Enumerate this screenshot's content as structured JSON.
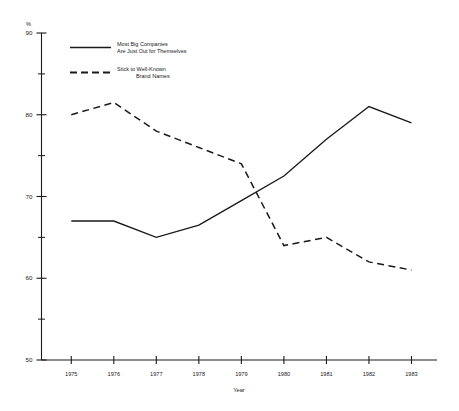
{
  "chart_data": {
    "type": "line",
    "title": "",
    "xlabel": "Year",
    "ylabel": "%",
    "unit_label": "%",
    "categories": [
      "1975",
      "1976",
      "1977",
      "1978",
      "1979",
      "1980",
      "1981",
      "1982",
      "1983"
    ],
    "x": [
      1975,
      1976,
      1977,
      1978,
      1979,
      1980,
      1981,
      1982,
      1983
    ],
    "ylim": [
      50,
      90
    ],
    "xlim": [
      1974.3,
      1983.6
    ],
    "grid": false,
    "legend_position": "top-left",
    "y_ticks_major": [
      50,
      60,
      70,
      80,
      90
    ],
    "y_ticks_minor": [
      55,
      65,
      75,
      85
    ],
    "y_tick_labels": [
      "50",
      "60",
      "70",
      "80",
      "90"
    ],
    "series": [
      {
        "name": "Most Big Companies Are Just Out for Themselves",
        "style": "solid",
        "color": "#1a1a1a",
        "values": [
          67,
          67,
          65,
          66.5,
          69.5,
          72.5,
          77,
          81,
          79
        ]
      },
      {
        "name": "Stick to Well-Known Brand Names",
        "style": "dashed",
        "color": "#1a1a1a",
        "values": [
          80,
          81.5,
          78,
          76,
          74,
          64,
          65,
          62,
          61
        ]
      }
    ]
  },
  "legend": {
    "entries": [
      {
        "style": "solid",
        "line1": "Most Big Companies",
        "line2": "Are Just Out for Themselves"
      },
      {
        "style": "dashed",
        "line1": "Stick to Well-Known",
        "line2": "Brand Names"
      }
    ]
  },
  "axes": {
    "y_unit": "%",
    "x_title": "Year"
  }
}
